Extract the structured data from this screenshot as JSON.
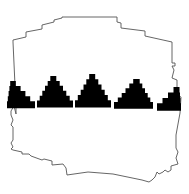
{
  "figure": {
    "colors": {
      "background": "#ffffff",
      "outline": "#555555",
      "motif_fill": "#000000"
    },
    "outline_points": "13,42 13,40 26,37 26,32 42,29 42,25 54,22 54,20 62,18 62,17 117,17 117,22 121,23 121,28 145,31 145,36 172,42 172,63 175,63 175,66 172,66 174,70 172,78 177,80 177,87 175,90 177,95 181,97 180,113 176,135 176,148 178,152 176,158 178,164 171,166 171,170 168,172 165,170 163,172 159,174 157,172 155,177 152,180 149,182 142,180 113,174 88,172 67,175 66,168 63,164 52,165 52,161 44,159 42,160 31,156 29,154 22,154 22,152 13,150 11,149 13,147 11,143 13,140 13,135 13,127 11,125 13,120 11,115 11,111 14,106 16,114 16,107",
    "band": {
      "baseline_y_left": 107,
      "baseline_y_right": 110,
      "triangles": [
        {
          "name": "partial-left",
          "x_left": 7,
          "x_right": 35,
          "apex_x": 11,
          "apex_y": 81,
          "steps": 5
        },
        {
          "name": "triangle-2",
          "x_left": 37,
          "x_right": 73,
          "apex_x": 53,
          "apex_y": 76,
          "steps": 6
        },
        {
          "name": "triangle-3",
          "x_left": 75,
          "x_right": 111,
          "apex_x": 92,
          "apex_y": 74,
          "steps": 6
        },
        {
          "name": "triangle-4",
          "x_left": 114,
          "x_right": 153,
          "apex_x": 137,
          "apex_y": 79,
          "steps": 6
        },
        {
          "name": "partial-right",
          "x_left": 157,
          "x_right": 181,
          "apex_x": 179,
          "apex_y": 87,
          "steps": 4
        }
      ]
    }
  }
}
